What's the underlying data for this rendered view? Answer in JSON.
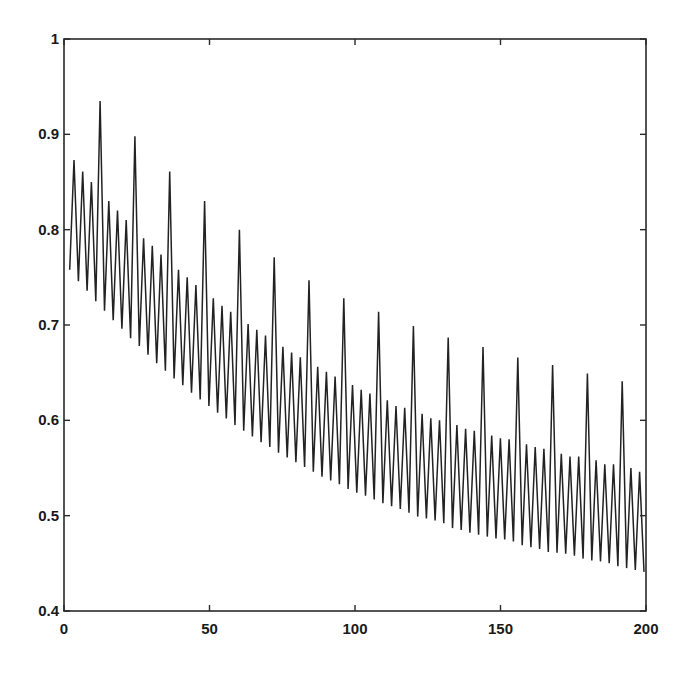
{
  "chart_data": {
    "type": "line",
    "title": "",
    "xlabel": "",
    "ylabel": "",
    "xlim": [
      0,
      200
    ],
    "ylim": [
      0.4,
      1.0
    ],
    "grid": false,
    "legend": null,
    "x_ticks": [
      0,
      50,
      100,
      150,
      200
    ],
    "x_tick_labels": [
      "0",
      "50",
      "100",
      "150",
      "200"
    ],
    "y_ticks": [
      0.4,
      0.5,
      0.6,
      0.7,
      0.8,
      0.9,
      1.0
    ],
    "y_tick_labels": [
      "0.4",
      "0.5",
      "0.6",
      "0.7",
      "0.8",
      "0.9",
      "1"
    ],
    "series": [
      {
        "name": "series-1",
        "color": "#222222",
        "minima": {
          "x": [
            1.96,
            4.95,
            7.94,
            10.93,
            13.92,
            16.91,
            19.9,
            22.89,
            25.88,
            28.87,
            31.86,
            34.85,
            37.84,
            40.83,
            43.82,
            46.81,
            49.8,
            52.79,
            55.78,
            58.77,
            61.76,
            64.75,
            67.74,
            70.73,
            73.72,
            76.71,
            79.7,
            82.69,
            85.68,
            88.67,
            91.66,
            94.65,
            97.64,
            100.63,
            103.62,
            106.61,
            109.6,
            112.59,
            115.58,
            118.57,
            121.56,
            124.55,
            127.54,
            130.53,
            133.52,
            136.51,
            139.5,
            142.49,
            145.48,
            148.47,
            151.46,
            154.45,
            157.44,
            160.43,
            163.42,
            166.41,
            169.4,
            172.39,
            175.38,
            178.37,
            181.36,
            184.35,
            187.34,
            190.33,
            193.32,
            196.31,
            199.3
          ],
          "y": [
            0.758,
            0.746,
            0.736,
            0.725,
            0.715,
            0.705,
            0.696,
            0.686,
            0.678,
            0.669,
            0.66,
            0.652,
            0.644,
            0.637,
            0.629,
            0.622,
            0.615,
            0.608,
            0.602,
            0.595,
            0.589,
            0.583,
            0.577,
            0.572,
            0.566,
            0.561,
            0.556,
            0.551,
            0.546,
            0.541,
            0.537,
            0.533,
            0.528,
            0.524,
            0.521,
            0.517,
            0.513,
            0.51,
            0.507,
            0.503,
            0.499,
            0.497,
            0.495,
            0.492,
            0.487,
            0.485,
            0.482,
            0.48,
            0.478,
            0.476,
            0.475,
            0.473,
            0.469,
            0.467,
            0.465,
            0.462,
            0.461,
            0.46,
            0.458,
            0.455,
            0.453,
            0.452,
            0.45,
            0.447,
            0.445,
            0.443,
            0.441
          ]
        },
        "peaks": {
          "x": [
            3.45,
            6.44,
            9.43,
            12.42,
            15.41,
            18.4,
            21.39,
            24.38,
            27.37,
            30.36,
            33.35,
            36.34,
            39.33,
            42.32,
            45.31,
            48.3,
            51.29,
            54.28,
            57.27,
            60.26,
            63.25,
            66.24,
            69.23,
            72.22,
            75.21,
            78.2,
            81.19,
            84.18,
            87.17,
            90.16,
            93.15,
            96.14,
            99.13,
            102.12,
            105.11,
            108.1,
            111.09,
            114.08,
            117.07,
            120.06,
            123.05,
            126.04,
            129.03,
            132.02,
            135.01,
            138.0,
            140.99,
            143.98,
            146.97,
            149.96,
            152.95,
            155.94,
            158.93,
            161.92,
            164.91,
            167.9,
            170.89,
            173.88,
            176.87,
            179.86,
            182.85,
            185.84,
            188.83,
            191.82,
            194.81,
            197.8
          ],
          "y": [
            0.873,
            0.861,
            0.85,
            0.935,
            0.83,
            0.82,
            0.81,
            0.898,
            0.791,
            0.783,
            0.774,
            0.861,
            0.758,
            0.75,
            0.742,
            0.83,
            0.728,
            0.72,
            0.714,
            0.8,
            0.701,
            0.695,
            0.689,
            0.771,
            0.677,
            0.671,
            0.666,
            0.747,
            0.656,
            0.651,
            0.646,
            0.728,
            0.637,
            0.632,
            0.628,
            0.714,
            0.621,
            0.615,
            0.613,
            0.699,
            0.607,
            0.602,
            0.6,
            0.687,
            0.595,
            0.591,
            0.589,
            0.677,
            0.584,
            0.581,
            0.58,
            0.666,
            0.575,
            0.572,
            0.57,
            0.658,
            0.565,
            0.562,
            0.562,
            0.649,
            0.558,
            0.554,
            0.554,
            0.641,
            0.55,
            0.546
          ]
        }
      }
    ]
  },
  "layout": {
    "plot_left": 64,
    "plot_top": 39,
    "plot_right": 646,
    "plot_bottom": 611,
    "tick_length": 6
  }
}
